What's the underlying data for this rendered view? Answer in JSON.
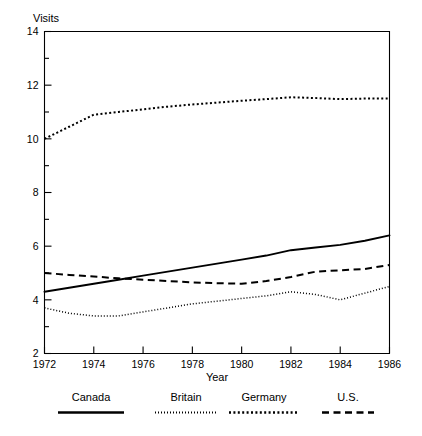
{
  "chart_data": {
    "type": "line",
    "title": "",
    "ylabel": "Visits",
    "xlabel": "Year",
    "xlim": [
      1972,
      1986
    ],
    "ylim": [
      2,
      14
    ],
    "grid": false,
    "legend_position": "bottom",
    "x_ticks": [
      1972,
      1974,
      1976,
      1978,
      1980,
      1982,
      1984,
      1986
    ],
    "x_minor_ticks": [
      1973,
      1975,
      1977,
      1979,
      1981,
      1983,
      1985
    ],
    "y_ticks": [
      2,
      4,
      6,
      8,
      10,
      12,
      14
    ],
    "y_minor_ticks": [
      3,
      5,
      7,
      9,
      11,
      13
    ],
    "x": [
      1972,
      1973,
      1974,
      1975,
      1976,
      1977,
      1978,
      1979,
      1980,
      1981,
      1982,
      1983,
      1984,
      1985,
      1986
    ],
    "series": [
      {
        "name": "Canada",
        "style": "solid",
        "values": [
          4.3,
          4.45,
          4.6,
          4.75,
          4.9,
          5.05,
          5.2,
          5.35,
          5.5,
          5.65,
          5.85,
          5.95,
          6.05,
          6.2,
          6.4
        ]
      },
      {
        "name": "Britain",
        "style": "dotted",
        "values": [
          3.7,
          3.5,
          3.4,
          3.4,
          3.55,
          3.7,
          3.85,
          3.95,
          4.05,
          4.15,
          4.3,
          4.2,
          4.0,
          4.25,
          4.5
        ]
      },
      {
        "name": "Germany",
        "style": "densely-dotted",
        "values": [
          10.0,
          10.45,
          10.9,
          11.0,
          11.1,
          11.2,
          11.28,
          11.35,
          11.42,
          11.48,
          11.55,
          11.52,
          11.48,
          11.5,
          11.5
        ]
      },
      {
        "name": "U.S.",
        "style": "dashed",
        "values": [
          5.0,
          4.93,
          4.87,
          4.8,
          4.75,
          4.7,
          4.65,
          4.62,
          4.6,
          4.7,
          4.85,
          5.05,
          5.1,
          5.15,
          5.3
        ]
      }
    ]
  },
  "axes": {
    "y_title": "Visits",
    "x_title": "Year",
    "y_tick_labels": [
      "14",
      "12",
      "10",
      "8",
      "6",
      "4",
      "2"
    ],
    "x_tick_labels": [
      "1972",
      "1974",
      "1976",
      "1978",
      "1980",
      "1982",
      "1984",
      "1986"
    ]
  },
  "legend": {
    "items": [
      {
        "label": "Canada",
        "style": "solid"
      },
      {
        "label": "Britain",
        "style": "dotted"
      },
      {
        "label": "Germany",
        "style": "densely-dotted"
      },
      {
        "label": "U.S.",
        "style": "dashed"
      }
    ]
  }
}
